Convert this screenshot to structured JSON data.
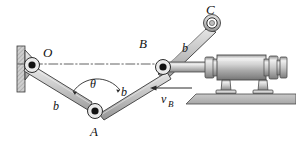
{
  "figure": {
    "type": "mechanism-kinematics-diagram",
    "background": "#ffffff",
    "width": 296,
    "height": 142,
    "stroke": "#2b2b2b",
    "link_fill_light": "#d8d8d8",
    "link_fill_mid": "#b8b8b8",
    "link_fill_dark": "#9a9a9a",
    "metal_light": "#e6e6e6",
    "metal_mid": "#b5b5b5",
    "metal_dark": "#8a8a8a",
    "hatch_fill": "#cccccc"
  },
  "labels": {
    "point_o": "O",
    "point_a": "A",
    "point_b": "B",
    "point_c": "C",
    "theta": "θ",
    "link_ob": "b",
    "link_ab": "b",
    "link_bc": "b",
    "velocity_b": "v",
    "velocity_b_sub": "B"
  },
  "points": {
    "O": {
      "x": 30,
      "y": 65,
      "kind": "filled-pivot"
    },
    "A": {
      "x": 95,
      "y": 110,
      "kind": "filled-pivot"
    },
    "B": {
      "x": 162,
      "y": 66,
      "kind": "filled-pivot"
    },
    "C": {
      "x": 212,
      "y": 23,
      "kind": "hollow-pivot"
    }
  },
  "links": [
    {
      "name": "link-OA",
      "from": "O",
      "to": "A",
      "label": "b"
    },
    {
      "name": "link-AB",
      "from": "A",
      "to": "B",
      "label": "b"
    },
    {
      "name": "link-BC",
      "from": "B",
      "to": "C",
      "label": "b"
    }
  ],
  "annotations": {
    "centerline": {
      "name": "centerline-OB",
      "x1": 18,
      "y1": 64,
      "x2": 176,
      "y2": 64,
      "style": "dash-dot"
    },
    "angle_arc": {
      "name": "theta-arc",
      "center": "A",
      "label": "θ"
    },
    "velocity_arrow": {
      "name": "velocity-b-arrow",
      "direction": "left",
      "label": "v_B"
    }
  },
  "components": {
    "wall_support": {
      "name": "wall-support",
      "hatched": true
    },
    "hydraulic_cylinder": {
      "name": "hydraulic-cylinder",
      "feet": 2
    },
    "piston_rod": {
      "name": "piston-rod"
    },
    "ground": {
      "name": "ground-surface",
      "hatched": true
    }
  }
}
